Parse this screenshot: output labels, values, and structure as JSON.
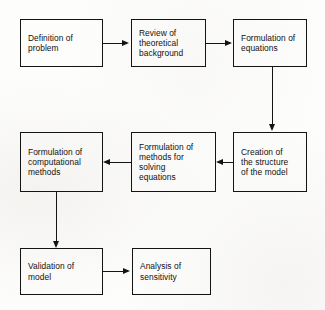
{
  "diagram": {
    "background_color": "#fdfdfc",
    "line_color": "#141414",
    "text_color": "#111111",
    "nodes": [
      {
        "id": "definition-of-problem",
        "label": "Definition  of\nproblem",
        "x": 20,
        "y": 19,
        "w": 83,
        "h": 48
      },
      {
        "id": "review-of-theoretical-background",
        "label": "Review of\ntheoretical\nbackground",
        "x": 131,
        "y": 19,
        "w": 75,
        "h": 48
      },
      {
        "id": "formulation-of-equations",
        "label": "Formulation of\nequations",
        "x": 233,
        "y": 19,
        "w": 74,
        "h": 48
      },
      {
        "id": "creation-of-the-structure-of-the-model",
        "label": "Creation of\nthe structure\nof the model",
        "x": 233,
        "y": 132,
        "w": 74,
        "h": 60
      },
      {
        "id": "formulation-of-methods-for-solving-equations",
        "label": "Formulation of\nmethods for\nsolving\nequations",
        "x": 131,
        "y": 132,
        "w": 85,
        "h": 60
      },
      {
        "id": "formulation-of-computational-methods",
        "label": "Formulation of\ncomputational\nmethods",
        "x": 20,
        "y": 132,
        "w": 83,
        "h": 60
      },
      {
        "id": "validation-of-model",
        "label": "Validation of\nmodel",
        "x": 20,
        "y": 248,
        "w": 83,
        "h": 47
      },
      {
        "id": "analysis-of-sensitivity",
        "label": "Analysis of\nsensitivity",
        "x": 132,
        "y": 248,
        "w": 79,
        "h": 47
      }
    ],
    "connectors": [
      {
        "id": "definition-to-review",
        "from": "definition-of-problem",
        "to": "review-of-theoretical-background",
        "direction": "right"
      },
      {
        "id": "review-to-formulation-equations",
        "from": "review-of-theoretical-background",
        "to": "formulation-of-equations",
        "direction": "right"
      },
      {
        "id": "equations-to-structure",
        "from": "formulation-of-equations",
        "to": "creation-of-the-structure-of-the-model",
        "direction": "down"
      },
      {
        "id": "structure-to-solving-methods",
        "from": "creation-of-the-structure-of-the-model",
        "to": "formulation-of-methods-for-solving-equations",
        "direction": "left"
      },
      {
        "id": "solving-methods-to-computational",
        "from": "formulation-of-methods-for-solving-equations",
        "to": "formulation-of-computational-methods",
        "direction": "left"
      },
      {
        "id": "computational-to-validation",
        "from": "formulation-of-computational-methods",
        "to": "validation-of-model",
        "direction": "down"
      },
      {
        "id": "validation-to-analysis",
        "from": "validation-of-model",
        "to": "analysis-of-sensitivity",
        "direction": "right"
      }
    ]
  }
}
